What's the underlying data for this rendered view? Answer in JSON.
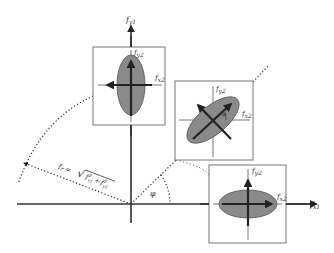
{
  "diagram": {
    "type": "coordinate-transformation-diagram",
    "axes": {
      "x_label": "f",
      "x_sub": "x1",
      "y_label": "f",
      "y_sub": "y1"
    },
    "angle_label": "φ",
    "magnitude_formula": {
      "lhs": "f",
      "lhs_sub": "r",
      "eq": "=",
      "rhs_radical": "√",
      "term1": "f",
      "term1_sup": "2",
      "term1_sub": "x1",
      "plus": "+",
      "term2": "f",
      "term2_sup": "2",
      "term2_sub": "y1"
    },
    "panels": [
      {
        "id": "top",
        "orientation": "vertical ellipse",
        "local_x_label": "f",
        "local_x_sub": "x2",
        "local_y_label": "f",
        "local_y_sub": "y2"
      },
      {
        "id": "middle",
        "orientation": "tilted ellipse (~45°)",
        "local_x_label": "f",
        "local_x_sub": "x2",
        "local_y_label": "f",
        "local_y_sub": "y2",
        "angle_label": "φ"
      },
      {
        "id": "bottom-right",
        "orientation": "horizontal ellipse",
        "local_x_label": "f",
        "local_x_sub": "x2",
        "local_y_label": "f",
        "local_y_sub": "y2"
      }
    ],
    "colors": {
      "axis": "#333333",
      "ellipse_fill": "#8a8a8a",
      "ellipse_stroke": "#555555",
      "box_stroke": "#777777",
      "arrow": "#222222",
      "dotted": "#333333"
    }
  }
}
